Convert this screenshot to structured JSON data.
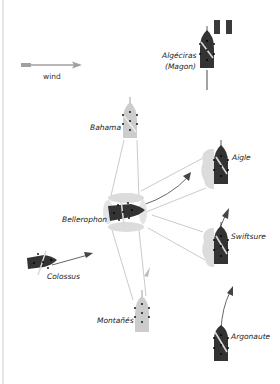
{
  "diagram": {
    "legend": {
      "wind_label": "wind",
      "wind_arrow_color": "#9a9a9a"
    },
    "colors": {
      "french_ship": "#333333",
      "spanish_ship": "#c8c8c8",
      "british_ship": "#3a3a3a",
      "smoke": "#d9d9d9",
      "fire_lines": "#bfbfbf",
      "course_arrows": "#444444",
      "flag_blue": "#3a3a3a",
      "flag_white": "#ffffff",
      "flag_red": "#3a3a3a"
    },
    "ships": {
      "algeciras": {
        "label_line1": "Algéciras",
        "label_line2": "(Magon)"
      },
      "bahama": {
        "label": "Bahama"
      },
      "aigle": {
        "label": "Aigle"
      },
      "bellerophon": {
        "label": "Bellerophon"
      },
      "swiftsure": {
        "label": "Swiftsure"
      },
      "colossus": {
        "label": "Colossus"
      },
      "montanes": {
        "label": "Montañés"
      },
      "argonaute": {
        "label": "Argonaute"
      }
    }
  }
}
